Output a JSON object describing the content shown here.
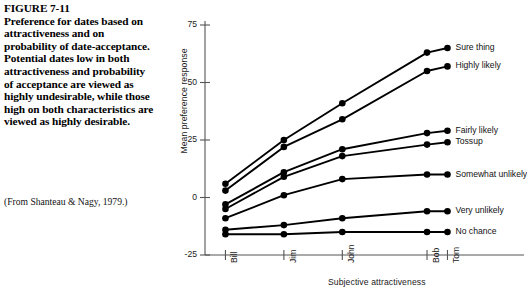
{
  "figure": {
    "title": "FIGURE 7-11",
    "caption": "Preference for dates based on attractiveness and on probability of date-acceptance. Potential dates low in both attractiveness and probability of acceptance are viewed as highly undesirable, while those high on both characteristics are viewed as highly desirable.",
    "source": "(From Shanteau & Nagy, 1979.)"
  },
  "chart_data": {
    "type": "line",
    "title": "",
    "xlabel": "Subjective attractiveness",
    "ylabel": "Mean preference response",
    "categories": [
      "Bill",
      "Jim",
      "John",
      "Bob",
      "Tom"
    ],
    "x_positions": [
      0,
      1,
      2,
      3.45,
      3.8
    ],
    "xlim": [
      -0.35,
      4.1
    ],
    "ylim": [
      -25,
      75
    ],
    "yticks": [
      -25,
      0,
      25,
      50,
      75
    ],
    "ytick_labels": [
      "-25",
      "0",
      "25",
      "50",
      "75"
    ],
    "grid": false,
    "legend_position": "right-inline-endpoint",
    "marker": "filled-circle",
    "series": [
      {
        "name": "Sure thing",
        "values": [
          6,
          25,
          41,
          63,
          65
        ]
      },
      {
        "name": "Highly likely",
        "values": [
          3,
          22,
          34,
          55,
          57
        ]
      },
      {
        "name": "Fairly likely",
        "values": [
          -3,
          11,
          21,
          28,
          29
        ]
      },
      {
        "name": "Tossup",
        "values": [
          -5,
          9,
          18,
          23,
          24
        ]
      },
      {
        "name": "Somewhat unlikely",
        "values": [
          -9,
          1,
          8,
          10,
          10
        ]
      },
      {
        "name": "Very unlikely",
        "values": [
          -14,
          -12,
          -9,
          -6,
          -6
        ]
      },
      {
        "name": "No chance",
        "values": [
          -16,
          -16,
          -15,
          -15,
          -15
        ]
      }
    ]
  }
}
